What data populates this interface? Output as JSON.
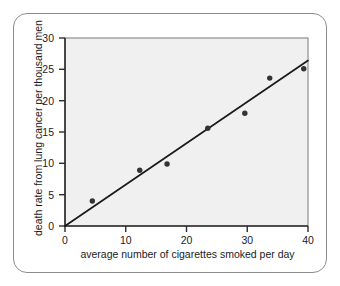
{
  "chart_data": {
    "type": "scatter",
    "title": "",
    "xlabel": "average number of cigarettes smoked per day",
    "ylabel": "death rate from lung cancer per thousand men",
    "xlim": [
      0,
      40
    ],
    "ylim": [
      0,
      30
    ],
    "xticks": [
      "0",
      "10",
      "20",
      "30",
      "40"
    ],
    "xtick_values": [
      0,
      10,
      20,
      30,
      40
    ],
    "yticks": [
      "0",
      "5",
      "10",
      "15",
      "20",
      "25",
      "30"
    ],
    "ytick_values": [
      0,
      5,
      10,
      15,
      20,
      25,
      30
    ],
    "grid": false,
    "legend": "none",
    "point_color": "#333333",
    "line_color": "#1a1a1a",
    "plot_background": "#f0f0f0",
    "points": [
      {
        "x": 4.5,
        "y": 4.0
      },
      {
        "x": 12.3,
        "y": 8.9
      },
      {
        "x": 16.8,
        "y": 9.9
      },
      {
        "x": 23.5,
        "y": 15.6
      },
      {
        "x": 29.6,
        "y": 18.0
      },
      {
        "x": 33.7,
        "y": 23.6
      },
      {
        "x": 39.3,
        "y": 25.1
      }
    ],
    "series": [
      {
        "name": "death rate observations",
        "x": [
          4.5,
          12.3,
          16.8,
          23.5,
          29.6,
          33.7,
          39.3
        ],
        "values": [
          4.0,
          8.9,
          9.9,
          15.6,
          18.0,
          23.6,
          25.1
        ]
      }
    ],
    "trend_line": {
      "name": "line of best fit",
      "x_start": 0,
      "y_start": 0,
      "x_end": 40,
      "y_end": 26.4
    }
  }
}
